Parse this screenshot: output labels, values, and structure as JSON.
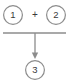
{
  "diagram": {
    "type": "summation-flow",
    "background_color": "#ffffff",
    "stroke_color": "#8c8c8c",
    "text_color": "#3a3a3a",
    "nodes": [
      {
        "id": "input-1",
        "label": "1",
        "shape": "circle",
        "cx": 13,
        "cy": 15,
        "r": 9.5
      },
      {
        "id": "input-2",
        "label": "2",
        "shape": "circle",
        "cx": 56,
        "cy": 15,
        "r": 9.5
      },
      {
        "id": "output-3",
        "label": "3",
        "shape": "circle",
        "cx": 35,
        "cy": 70,
        "r": 9.5
      }
    ],
    "operator": {
      "id": "plus-operator",
      "label": "+",
      "x": 35,
      "y": 15
    },
    "connector": {
      "id": "merge-bar",
      "orientation": "horizontal",
      "x1": 3,
      "x2": 66,
      "y": 33
    },
    "arrow": {
      "id": "down-arrow",
      "direction": "down",
      "x": 35,
      "y1": 33,
      "y2": 59
    }
  }
}
